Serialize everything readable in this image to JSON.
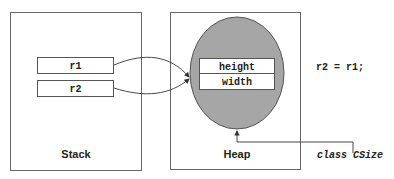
{
  "stack": {
    "label": "Stack",
    "vars": [
      {
        "name": "r1"
      },
      {
        "name": "r2"
      }
    ]
  },
  "heap": {
    "label": "Heap",
    "fields": [
      {
        "name": "height"
      },
      {
        "name": "width"
      }
    ],
    "object_fill": "#a6a6a6"
  },
  "code": "r2 = r1;",
  "class_label": "class CSize"
}
